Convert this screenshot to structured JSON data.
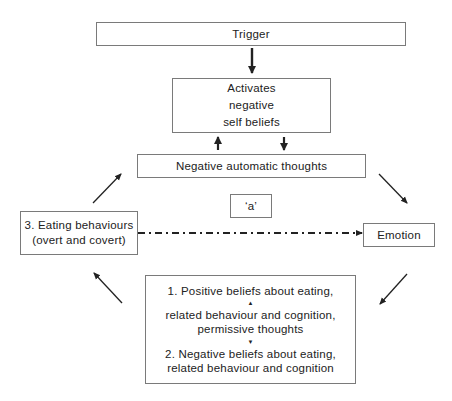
{
  "diagram": {
    "nodes": {
      "trigger": {
        "label": "Trigger"
      },
      "activates": {
        "lines": [
          "Activates",
          "negative",
          "self beliefs"
        ]
      },
      "nat": {
        "label": "Negative automatic thoughts"
      },
      "a": {
        "label": "‘a’"
      },
      "eating": {
        "lines": [
          "3. Eating behaviours",
          "(overt and covert)"
        ]
      },
      "emotion": {
        "label": "Emotion"
      },
      "beliefs": {
        "lines": [
          "1. Positive beliefs about eating,",
          "related behaviour and cognition,",
          "permissive thoughts",
          "2. Negative beliefs about eating,",
          "related behaviour and cognition"
        ],
        "up_marker": "▲",
        "down_marker": "▼"
      }
    },
    "edges": [
      {
        "from": "trigger",
        "to": "activates",
        "style": "solid-bold"
      },
      {
        "from": "nat",
        "to": "activates",
        "style": "solid-bold"
      },
      {
        "from": "activates",
        "to": "nat",
        "style": "solid-bold"
      },
      {
        "from": "nat",
        "to": "emotion",
        "style": "solid"
      },
      {
        "from": "emotion",
        "to": "beliefs",
        "style": "solid"
      },
      {
        "from": "beliefs",
        "to": "eating",
        "style": "solid"
      },
      {
        "from": "eating",
        "to": "nat",
        "style": "solid"
      },
      {
        "from": "eating",
        "to": "emotion",
        "style": "dash-dot",
        "label_ref": "a"
      }
    ],
    "colors": {
      "stroke": "#222222",
      "border": "#7a7a7a",
      "background": "#ffffff"
    }
  }
}
